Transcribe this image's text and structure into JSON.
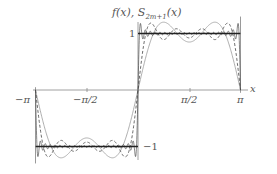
{
  "chart_data": {
    "type": "line",
    "ylabel": "f(x), S_{2m+1}(x)",
    "xlabel": "x",
    "xlim": [
      -3.14159,
      3.14159
    ],
    "ylim": [
      -1.3,
      1.3
    ],
    "grid": false,
    "legend": "none",
    "x_ticks": [
      {
        "value": -3.14159,
        "label": "−π"
      },
      {
        "value": -1.5708,
        "label": "−π/2"
      },
      {
        "value": 1.5708,
        "label": "π/2"
      },
      {
        "value": 3.14159,
        "label": "π"
      }
    ],
    "y_ticks": [
      {
        "value": 1,
        "label": "1"
      },
      {
        "value": -1,
        "label": "−1"
      }
    ],
    "series": [
      {
        "name": "f(x) square wave",
        "style": "solid-thick",
        "description": "f(x) = -1 for -π<x<0, +1 for 0<x<π"
      },
      {
        "name": "S_3(x)",
        "style": "solid-thin",
        "terms": [
          1,
          3
        ]
      },
      {
        "name": "S_7(x)",
        "style": "dashed",
        "terms": [
          1,
          3,
          5,
          7
        ]
      },
      {
        "name": "S_high(x)",
        "style": "solid-thin-dark",
        "terms_up_to": 41
      }
    ]
  },
  "labels": {
    "y_axis_title": "f(x), S",
    "y_axis_sub": "2m+1",
    "y_axis_tail": "(x)",
    "x_axis_name": "x",
    "tick_neg_pi": "−π",
    "tick_neg_half_pi": "−π/2",
    "tick_half_pi": "π/2",
    "tick_pi": "π",
    "tick_one": "1",
    "tick_neg_one": "−1"
  }
}
